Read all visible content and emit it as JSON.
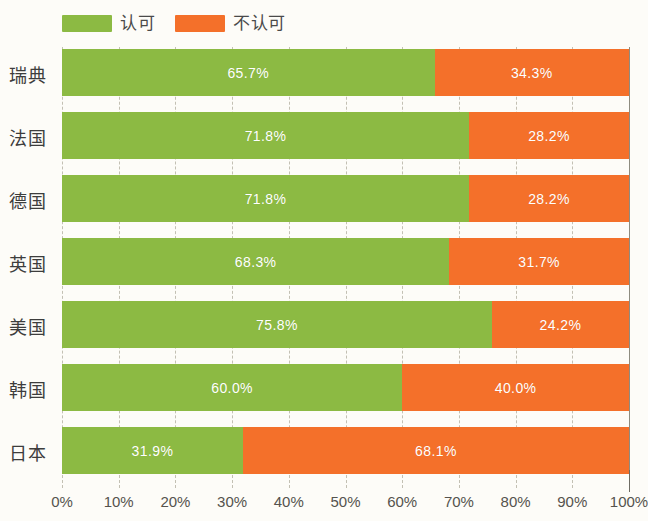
{
  "legend": {
    "items": [
      {
        "label": "认可",
        "color": "#8CBA43",
        "swatch_name": "legend-swatch-approve"
      },
      {
        "label": "不认可",
        "color": "#F4702A",
        "swatch_name": "legend-swatch-disapprove"
      }
    ]
  },
  "axis": {
    "ticks": [
      "0%",
      "10%",
      "20%",
      "30%",
      "40%",
      "50%",
      "60%",
      "70%",
      "80%",
      "90%",
      "100%"
    ],
    "min": 0,
    "max": 100
  },
  "chart_data": {
    "type": "bar",
    "orientation": "horizontal",
    "stacked": true,
    "normalized_percent": true,
    "title": "",
    "subtitle": "",
    "xlabel": "",
    "ylabel": "",
    "xlim": [
      0,
      100
    ],
    "grid": true,
    "legend_position": "top-left",
    "categories": [
      "瑞典",
      "法国",
      "德国",
      "英国",
      "美国",
      "韩国",
      "日本"
    ],
    "series": [
      {
        "name": "认可",
        "color": "#8CBA43",
        "values": [
          65.7,
          71.8,
          71.8,
          68.3,
          75.8,
          60.0,
          31.9
        ],
        "labels": [
          "65.7%",
          "71.8%",
          "71.8%",
          "68.3%",
          "75.8%",
          "60.0%",
          "31.9%"
        ]
      },
      {
        "name": "不认可",
        "color": "#F4702A",
        "values": [
          34.3,
          28.2,
          28.2,
          31.7,
          24.2,
          40.0,
          68.1
        ],
        "labels": [
          "34.3%",
          "28.2%",
          "28.2%",
          "31.7%",
          "24.2%",
          "40.0%",
          "68.1%"
        ]
      }
    ],
    "rows": [
      {
        "category": "瑞典",
        "approve": 65.7,
        "disapprove": 34.3,
        "approve_label": "65.7%",
        "disapprove_label": "34.3%"
      },
      {
        "category": "法国",
        "approve": 71.8,
        "disapprove": 28.2,
        "approve_label": "71.8%",
        "disapprove_label": "28.2%"
      },
      {
        "category": "德国",
        "approve": 71.8,
        "disapprove": 28.2,
        "approve_label": "71.8%",
        "disapprove_label": "28.2%"
      },
      {
        "category": "英国",
        "approve": 68.3,
        "disapprove": 31.7,
        "approve_label": "68.3%",
        "disapprove_label": "31.7%"
      },
      {
        "category": "美国",
        "approve": 75.8,
        "disapprove": 24.2,
        "approve_label": "75.8%",
        "disapprove_label": "24.2%"
      },
      {
        "category": "韩国",
        "approve": 60.0,
        "disapprove": 40.0,
        "approve_label": "60.0%",
        "disapprove_label": "40.0%"
      },
      {
        "category": "日本",
        "approve": 31.9,
        "disapprove": 68.1,
        "approve_label": "31.9%",
        "disapprove_label": "68.1%"
      }
    ]
  },
  "colors": {
    "approve": "#8CBA43",
    "disapprove": "#F4702A",
    "background": "#fdfcf8",
    "gridline": "#b9b6a8",
    "axis_text": "#55534e",
    "category_text": "#3d3d3d"
  }
}
